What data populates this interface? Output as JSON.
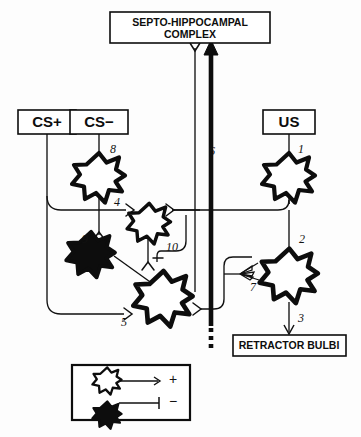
{
  "figure": {
    "type": "neural-circuit-diagram",
    "background_color": "#fdfdfd",
    "ink_color": "#0d0d0d"
  },
  "boxes": {
    "septo_hippocampal": {
      "line1": "SEPTO-HIPPOCAMPAL",
      "line2": "COMPLEX"
    },
    "cs_plus": {
      "label": "CS+"
    },
    "cs_minus": {
      "label": "CS−"
    },
    "us": {
      "label": "US"
    },
    "retractor_bulbi": {
      "label": "RETRACTOR BULBI"
    }
  },
  "pathway_numbers": {
    "n1": "1",
    "n2": "2",
    "n3": "3",
    "n4": "4",
    "n5": "5",
    "n6": "6",
    "n7": "7",
    "n8": "8",
    "n9": "9",
    "n10": "10"
  },
  "legend": {
    "excitatory": {
      "symbol": "open-star",
      "sign": "+"
    },
    "inhibitory": {
      "symbol": "filled-star",
      "sign": "−"
    }
  },
  "neurons": [
    {
      "id": "neuron-us",
      "fill": "open",
      "sign": "+",
      "input_synapse": "1"
    },
    {
      "id": "neuron-cs-minus",
      "fill": "open",
      "sign": "+",
      "input_synapse": "8"
    },
    {
      "id": "neuron-interneuron-4",
      "fill": "open",
      "sign": "+",
      "input_synapse": "4"
    },
    {
      "id": "neuron-inhibitory-9",
      "fill": "filled",
      "sign": "−",
      "input_synapse": "9"
    },
    {
      "id": "neuron-output-5",
      "fill": "open",
      "sign": "+",
      "input_synapse": "5"
    },
    {
      "id": "neuron-motor-2",
      "fill": "open",
      "sign": "+",
      "input_synapse": "2"
    }
  ]
}
